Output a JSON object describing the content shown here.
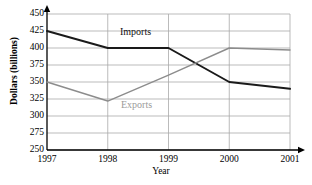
{
  "chart_data": {
    "type": "line",
    "title": "",
    "xlabel": "Year",
    "ylabel": "Dollars (billions)",
    "categories": [
      "1997",
      "1998",
      "1999",
      "2000",
      "2001"
    ],
    "x": [
      1997,
      1998,
      1999,
      2000,
      2001
    ],
    "xlim": [
      1997,
      2001
    ],
    "ylim": [
      250,
      450
    ],
    "yticks": [
      250,
      275,
      300,
      325,
      350,
      375,
      400,
      425,
      450
    ],
    "ytick_labels": [
      "250",
      "275",
      "300",
      "325",
      "350",
      "375",
      "400",
      "425",
      "450"
    ],
    "xtick_labels": [
      "1997",
      "1998",
      "1999",
      "2000",
      "2001"
    ],
    "grid": "horizontal-and-vertical",
    "legend_position": "inline-annotations",
    "series": [
      {
        "name": "Imports",
        "color": "#1a1a1a",
        "values": [
          425,
          400,
          400,
          350,
          340
        ]
      },
      {
        "name": "Exports",
        "color": "#8c8c8c",
        "values": [
          350,
          322,
          360,
          400,
          397
        ]
      }
    ],
    "annotations": [
      {
        "text": "Imports",
        "series": "Imports"
      },
      {
        "text": "Exports",
        "series": "Exports"
      }
    ]
  },
  "axes": {
    "y_title": "Dollars (billions)",
    "x_title": "Year"
  },
  "colors": {
    "imports_line": "#1a1a1a",
    "exports_line": "#8c8c8c",
    "gridline": "#aaaaaa",
    "axis": "#000000",
    "background": "#ffffff"
  }
}
